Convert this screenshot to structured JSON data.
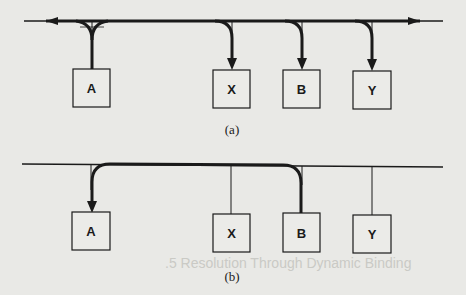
{
  "figure": {
    "panel_a": {
      "caption": "(a)",
      "description": "Broadcast from A: message travels both directions on bus and is delivered to X, B, Y",
      "nodes": [
        {
          "id": "A",
          "label": "A",
          "role": "sender"
        },
        {
          "id": "X",
          "label": "X",
          "role": "receiver"
        },
        {
          "id": "B",
          "label": "B",
          "role": "receiver"
        },
        {
          "id": "Y",
          "label": "Y",
          "role": "receiver"
        }
      ],
      "arrows": [
        {
          "from": "A",
          "to": "bus-left",
          "style": "bold"
        },
        {
          "from": "A",
          "to": "bus-right",
          "style": "bold"
        },
        {
          "from": "bus",
          "to": "X",
          "style": "bold"
        },
        {
          "from": "bus",
          "to": "B",
          "style": "bold"
        },
        {
          "from": "bus",
          "to": "Y",
          "style": "bold"
        }
      ]
    },
    "panel_b": {
      "caption": "(b)",
      "description": "Point-to-point: message from B delivered only to A",
      "nodes": [
        {
          "id": "A",
          "label": "A",
          "role": "receiver"
        },
        {
          "id": "X",
          "label": "X",
          "role": "idle"
        },
        {
          "id": "B",
          "label": "B",
          "role": "sender"
        },
        {
          "id": "Y",
          "label": "Y",
          "role": "idle"
        }
      ],
      "arrows": [
        {
          "from": "B",
          "to": "A",
          "style": "bold"
        }
      ]
    }
  },
  "background_text": {
    "section_heading_fragment": ".5 Resolution Through Dynamic Binding"
  },
  "colors": {
    "ink": "#1a1a1a",
    "paper": "#e9e9e6",
    "box_fill": "#ebebe8"
  }
}
